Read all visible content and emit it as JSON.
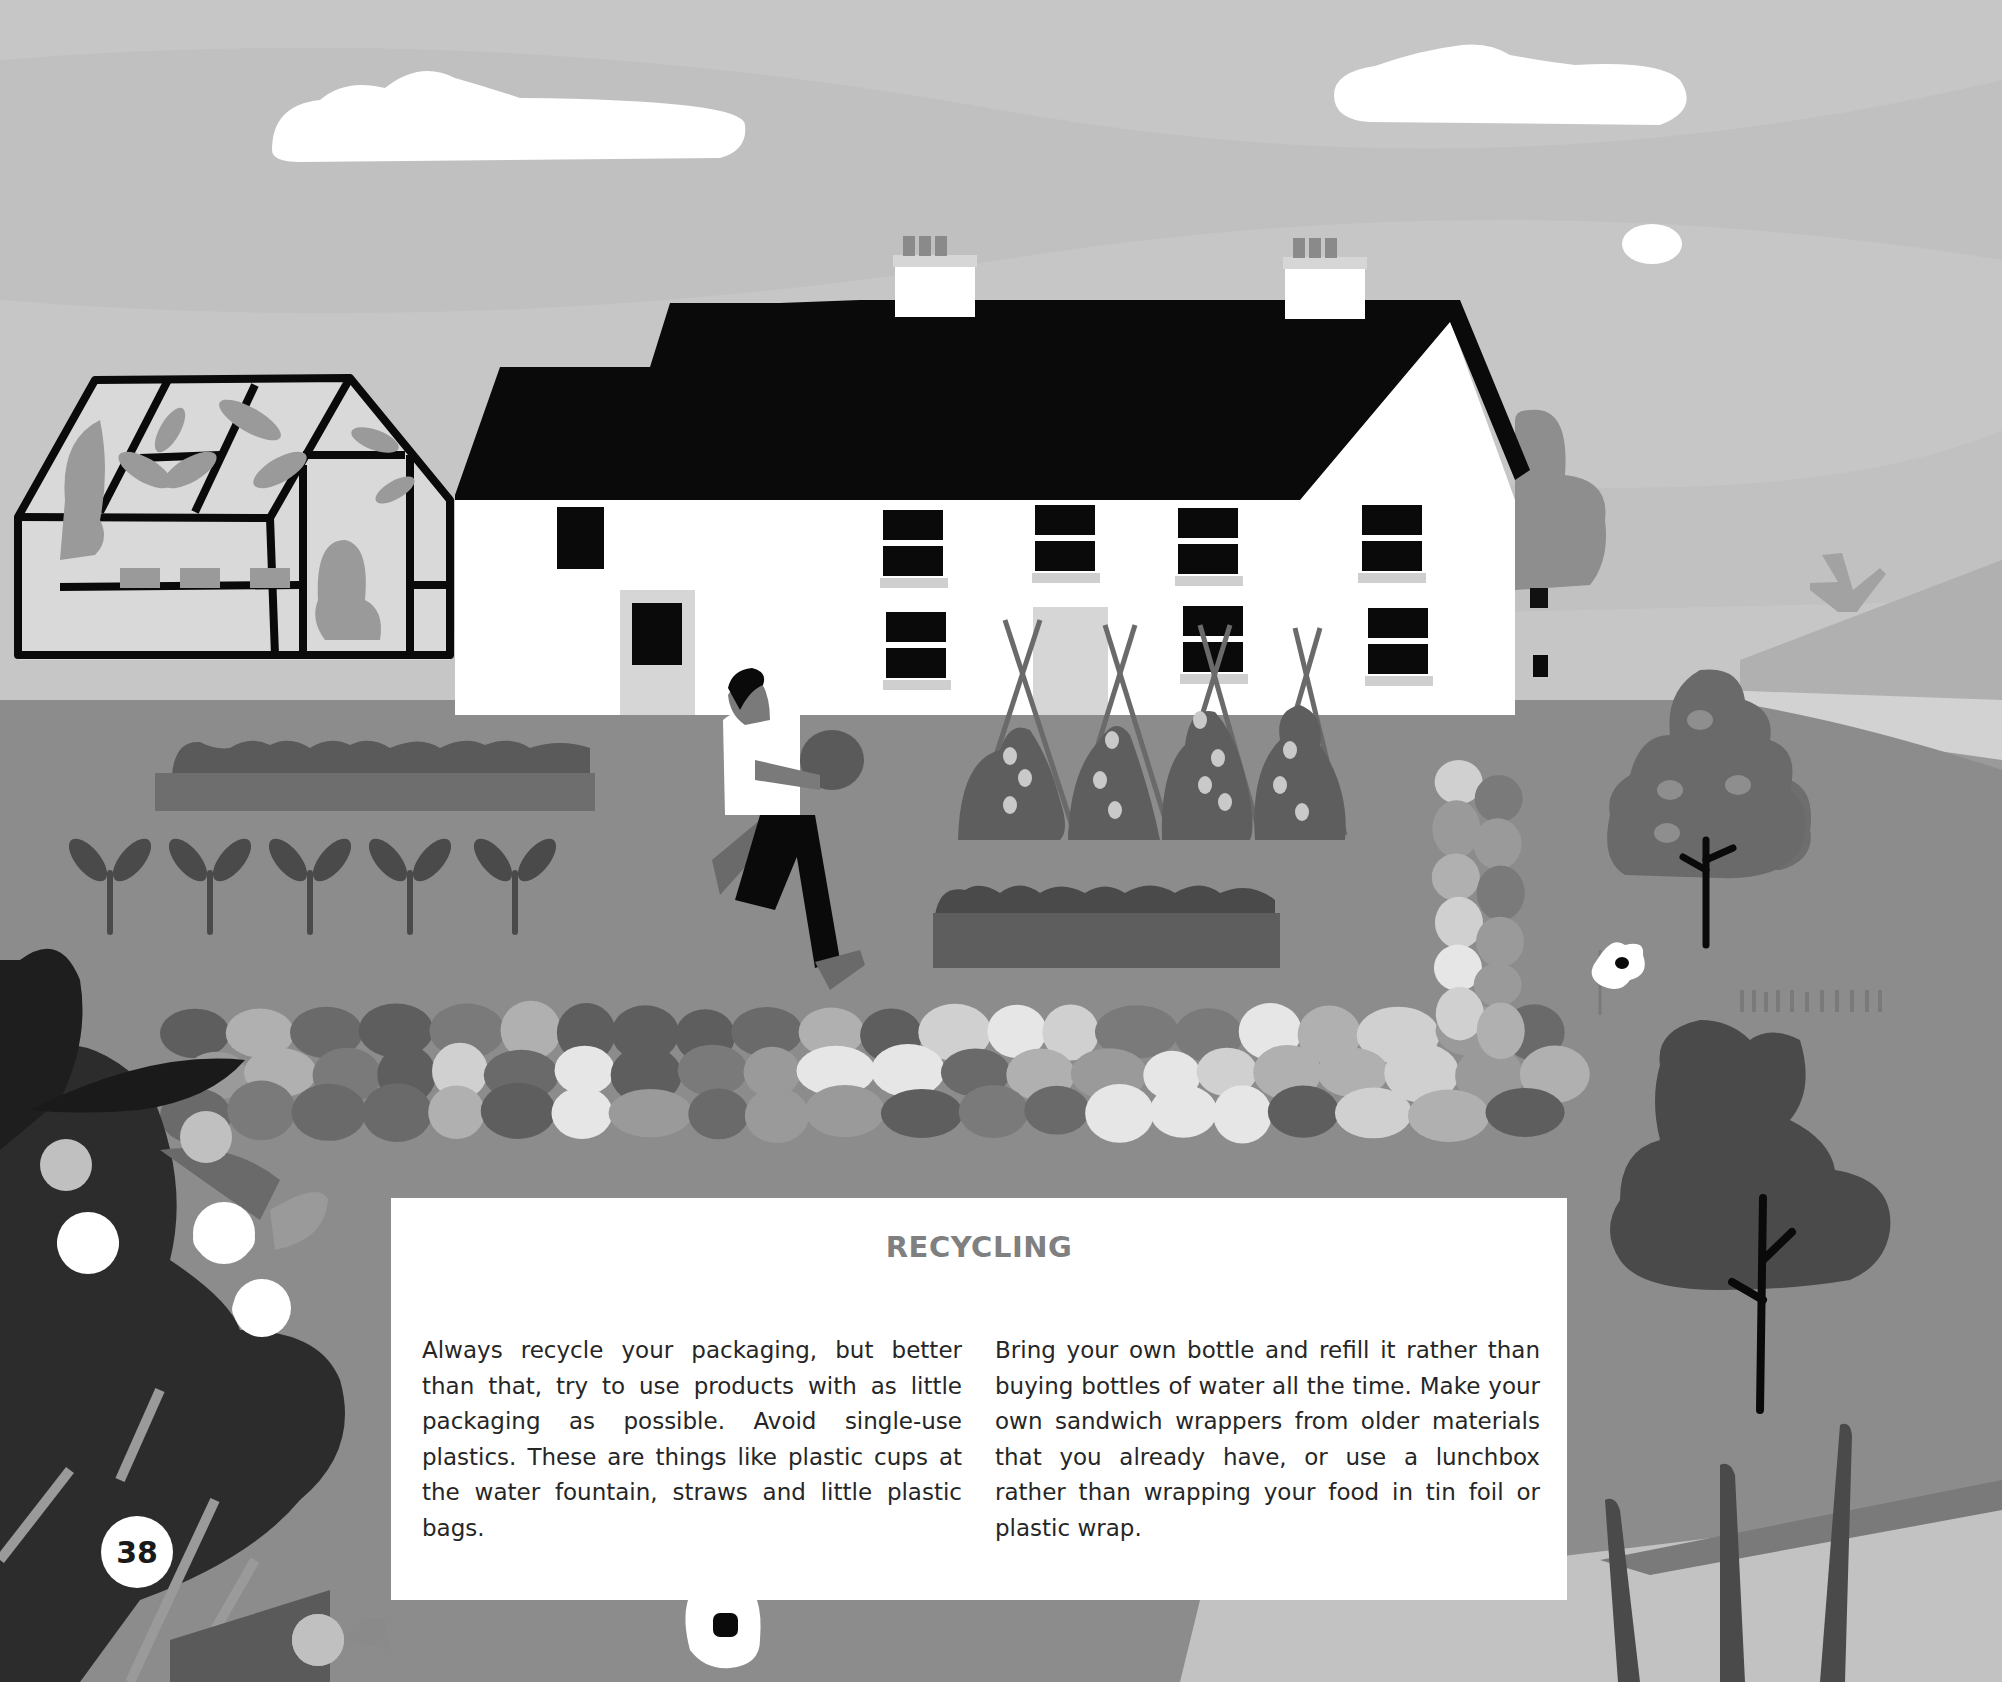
{
  "page": {
    "number": "38",
    "title": "RECYCLING",
    "paragraphs": [
      "Always recycle your packaging, but better than that, try to use products with as little packaging as possible. Avoid single-use plastics. These are things like plastic cups at the water fountain, straws and little plastic bags.",
      "Bring your own bottle and refill it rather than buying bottles of water all the time. Make your own sandwich wrappers from older materials that you already have, or use a lunchbox rather than wrapping your food in tin foil or plastic wrap."
    ]
  },
  "illustration": {
    "description": "Grayscale illustration of a white farmhouse with black roof and two chimneys, a greenhouse with plants, a person carrying a basket running across a garden, raised vegetable beds, bean poles with plants, a dry stone wall, trees, a bird and white flowers.",
    "elements": [
      "clouds",
      "greenhouse",
      "farmhouse",
      "chimneys",
      "person-carrying-basket",
      "raised-beds",
      "seedlings",
      "bean-teepees",
      "stone-wall",
      "trees",
      "bird",
      "hill",
      "flowers"
    ]
  },
  "colors": {
    "sky": "#c8c8c8",
    "ground": "#8a8a8a",
    "roof": "#0a0a0a",
    "house": "#ffffff",
    "title": "#808080",
    "body_text": "#262626"
  }
}
